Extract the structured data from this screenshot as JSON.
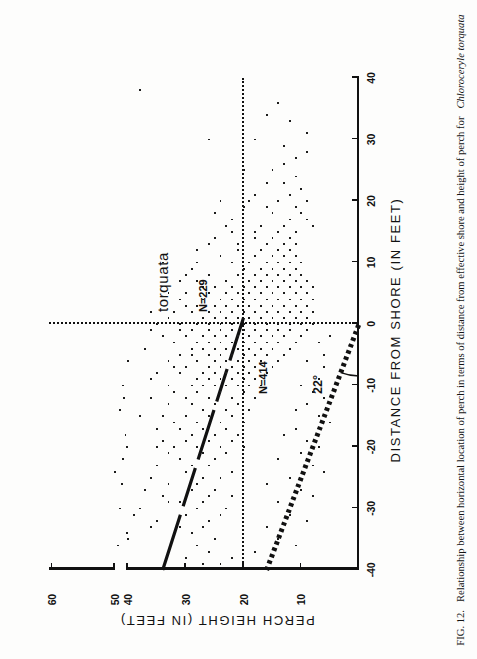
{
  "figure": {
    "caption_prefix": "FIG. 12.",
    "caption_body": "Relationship between horizontal location of perch in terms of distance from effective shore and height of perch for",
    "caption_species": "Chloroceryle torquata"
  },
  "annotations": {
    "species_label": "torquata",
    "n_upper": "N=229",
    "n_lower": "N=414",
    "angle_label": "22°"
  },
  "chart_data": {
    "type": "scatter",
    "title": "",
    "xlabel": "DISTANCE  FROM  SHORE   (IN  FEET)",
    "ylabel": "PERCH    HEIGHT    (IN FEET)",
    "xlim": [
      -40,
      40
    ],
    "ylim": [
      0,
      60
    ],
    "xticks": [
      -40,
      -30,
      -20,
      -10,
      0,
      10,
      20,
      30,
      40
    ],
    "xticklabels": [
      "-40",
      "-30",
      "-20",
      "-10",
      "0",
      "10",
      "20",
      "30",
      "40"
    ],
    "yticks": [
      10,
      20,
      30,
      40,
      50,
      60
    ],
    "yticklabels": [
      "10",
      "20",
      "30",
      "40",
      "50",
      "60"
    ],
    "y_axis_break_between": [
      40,
      50
    ],
    "grid": false,
    "legend": null,
    "reference_lines": [
      {
        "name": "shore-line",
        "orientation": "vertical",
        "x": 0,
        "style": "dotted"
      },
      {
        "name": "height-line",
        "orientation": "horizontal",
        "y": 20,
        "style": "dotted"
      }
    ],
    "fit_lines": [
      {
        "name": "regression-line",
        "style": "solid-dashed",
        "x1": -40,
        "y1": 34,
        "x2": 1,
        "y2": 20
      },
      {
        "name": "angle-ray",
        "style": "thick-dotted",
        "x1": -40,
        "y1": 16,
        "x2": 0,
        "y2": 0,
        "angle_deg": 22
      }
    ],
    "counts": {
      "above_shore": 229,
      "below_shore": 414
    },
    "points": [
      [
        -39,
        27
      ],
      [
        -38,
        30
      ],
      [
        -37,
        26
      ],
      [
        -36,
        28
      ],
      [
        -35,
        25
      ],
      [
        -34,
        29
      ],
      [
        -33,
        27
      ],
      [
        -33,
        31
      ],
      [
        -32,
        26
      ],
      [
        -31,
        30
      ],
      [
        -31,
        24
      ],
      [
        -30,
        28
      ],
      [
        -30,
        23
      ],
      [
        -29,
        27
      ],
      [
        -29,
        31
      ],
      [
        -28,
        26
      ],
      [
        -28,
        22
      ],
      [
        -27,
        29
      ],
      [
        -27,
        25
      ],
      [
        -26,
        28
      ],
      [
        -26,
        33
      ],
      [
        -25,
        24
      ],
      [
        -25,
        27
      ],
      [
        -24,
        30
      ],
      [
        -24,
        22
      ],
      [
        -23,
        26
      ],
      [
        -23,
        29
      ],
      [
        -22,
        25
      ],
      [
        -22,
        31
      ],
      [
        -21,
        23
      ],
      [
        -21,
        27
      ],
      [
        -20,
        20
      ],
      [
        -20,
        24
      ],
      [
        -20,
        28
      ],
      [
        -20,
        32
      ],
      [
        -20,
        35
      ],
      [
        -19,
        22
      ],
      [
        -19,
        26
      ],
      [
        -19,
        30
      ],
      [
        -18,
        21
      ],
      [
        -18,
        25
      ],
      [
        -18,
        29
      ],
      [
        -17,
        23
      ],
      [
        -17,
        27
      ],
      [
        -17,
        31
      ],
      [
        -16,
        20
      ],
      [
        -16,
        24
      ],
      [
        -16,
        28
      ],
      [
        -15,
        22
      ],
      [
        -15,
        26
      ],
      [
        -15,
        30
      ],
      [
        -15,
        34
      ],
      [
        -14,
        19
      ],
      [
        -14,
        23
      ],
      [
        -14,
        27
      ],
      [
        -13,
        21
      ],
      [
        -13,
        25
      ],
      [
        -13,
        29
      ],
      [
        -12,
        18
      ],
      [
        -12,
        22
      ],
      [
        -12,
        26
      ],
      [
        -12,
        30
      ],
      [
        -11,
        20
      ],
      [
        -11,
        24
      ],
      [
        -11,
        28
      ],
      [
        -10,
        17
      ],
      [
        -10,
        19
      ],
      [
        -10,
        21
      ],
      [
        -10,
        23
      ],
      [
        -10,
        25
      ],
      [
        -10,
        27
      ],
      [
        -10,
        29
      ],
      [
        -10,
        33
      ],
      [
        -9,
        18
      ],
      [
        -9,
        20
      ],
      [
        -9,
        22
      ],
      [
        -9,
        24
      ],
      [
        -9,
        26
      ],
      [
        -9,
        28
      ],
      [
        -8,
        16
      ],
      [
        -8,
        19
      ],
      [
        -8,
        21
      ],
      [
        -8,
        23
      ],
      [
        -8,
        25
      ],
      [
        -8,
        27
      ],
      [
        -7,
        15
      ],
      [
        -7,
        18
      ],
      [
        -7,
        20
      ],
      [
        -7,
        22
      ],
      [
        -7,
        24
      ],
      [
        -7,
        26
      ],
      [
        -7,
        30
      ],
      [
        -6,
        14
      ],
      [
        -6,
        17
      ],
      [
        -6,
        19
      ],
      [
        -6,
        21
      ],
      [
        -6,
        23
      ],
      [
        -6,
        25
      ],
      [
        -6,
        28
      ],
      [
        -5,
        13
      ],
      [
        -5,
        16
      ],
      [
        -5,
        18
      ],
      [
        -5,
        20
      ],
      [
        -5,
        22
      ],
      [
        -5,
        24
      ],
      [
        -5,
        26
      ],
      [
        -5,
        29
      ],
      [
        -4,
        12
      ],
      [
        -4,
        15
      ],
      [
        -4,
        17
      ],
      [
        -4,
        19
      ],
      [
        -4,
        21
      ],
      [
        -4,
        23
      ],
      [
        -4,
        25
      ],
      [
        -4,
        27
      ],
      [
        -3,
        11
      ],
      [
        -3,
        14
      ],
      [
        -3,
        16
      ],
      [
        -3,
        18
      ],
      [
        -3,
        20
      ],
      [
        -3,
        22
      ],
      [
        -3,
        24
      ],
      [
        -3,
        26
      ],
      [
        -3,
        28
      ],
      [
        -2,
        10
      ],
      [
        -2,
        13
      ],
      [
        -2,
        15
      ],
      [
        -2,
        17
      ],
      [
        -2,
        19
      ],
      [
        -2,
        21
      ],
      [
        -2,
        23
      ],
      [
        -2,
        25
      ],
      [
        -2,
        27
      ],
      [
        -1,
        9
      ],
      [
        -1,
        12
      ],
      [
        -1,
        14
      ],
      [
        -1,
        16
      ],
      [
        -1,
        18
      ],
      [
        -1,
        20
      ],
      [
        -1,
        22
      ],
      [
        -1,
        24
      ],
      [
        -1,
        26
      ],
      [
        -1,
        29
      ],
      [
        0,
        8
      ],
      [
        0,
        10
      ],
      [
        0,
        12
      ],
      [
        0,
        14
      ],
      [
        0,
        16
      ],
      [
        0,
        18
      ],
      [
        0,
        20
      ],
      [
        0,
        22
      ],
      [
        0,
        24
      ],
      [
        0,
        26
      ],
      [
        0,
        28
      ],
      [
        0,
        31
      ],
      [
        1,
        9
      ],
      [
        1,
        11
      ],
      [
        1,
        13
      ],
      [
        1,
        15
      ],
      [
        1,
        17
      ],
      [
        1,
        19
      ],
      [
        1,
        21
      ],
      [
        1,
        23
      ],
      [
        1,
        25
      ],
      [
        1,
        27
      ],
      [
        2,
        8
      ],
      [
        2,
        10
      ],
      [
        2,
        12
      ],
      [
        2,
        14
      ],
      [
        2,
        16
      ],
      [
        2,
        18
      ],
      [
        2,
        20
      ],
      [
        2,
        22
      ],
      [
        2,
        24
      ],
      [
        2,
        26
      ],
      [
        2,
        29
      ],
      [
        3,
        9
      ],
      [
        3,
        11
      ],
      [
        3,
        13
      ],
      [
        3,
        15
      ],
      [
        3,
        17
      ],
      [
        3,
        19
      ],
      [
        3,
        21
      ],
      [
        3,
        23
      ],
      [
        3,
        25
      ],
      [
        3,
        28
      ],
      [
        4,
        8
      ],
      [
        4,
        10
      ],
      [
        4,
        12
      ],
      [
        4,
        14
      ],
      [
        4,
        16
      ],
      [
        4,
        18
      ],
      [
        4,
        20
      ],
      [
        4,
        22
      ],
      [
        4,
        24
      ],
      [
        4,
        27
      ],
      [
        5,
        9
      ],
      [
        5,
        11
      ],
      [
        5,
        13
      ],
      [
        5,
        15
      ],
      [
        5,
        17
      ],
      [
        5,
        19
      ],
      [
        5,
        21
      ],
      [
        5,
        23
      ],
      [
        5,
        26
      ],
      [
        5,
        30
      ],
      [
        6,
        8
      ],
      [
        6,
        10
      ],
      [
        6,
        12
      ],
      [
        6,
        14
      ],
      [
        6,
        16
      ],
      [
        6,
        18
      ],
      [
        6,
        20
      ],
      [
        6,
        22
      ],
      [
        6,
        25
      ],
      [
        7,
        9
      ],
      [
        7,
        11
      ],
      [
        7,
        13
      ],
      [
        7,
        15
      ],
      [
        7,
        17
      ],
      [
        7,
        19
      ],
      [
        7,
        23
      ],
      [
        8,
        10
      ],
      [
        8,
        12
      ],
      [
        8,
        14
      ],
      [
        8,
        16
      ],
      [
        8,
        18
      ],
      [
        8,
        21
      ],
      [
        8,
        26
      ],
      [
        9,
        11
      ],
      [
        9,
        13
      ],
      [
        9,
        15
      ],
      [
        9,
        17
      ],
      [
        9,
        20
      ],
      [
        10,
        10
      ],
      [
        10,
        12
      ],
      [
        10,
        14
      ],
      [
        10,
        16
      ],
      [
        10,
        19
      ],
      [
        10,
        22
      ],
      [
        10,
        34
      ],
      [
        11,
        11
      ],
      [
        11,
        13
      ],
      [
        11,
        15
      ],
      [
        11,
        18
      ],
      [
        12,
        12
      ],
      [
        12,
        14
      ],
      [
        12,
        17
      ],
      [
        12,
        21
      ],
      [
        13,
        11
      ],
      [
        13,
        13
      ],
      [
        13,
        16
      ],
      [
        13,
        26
      ],
      [
        14,
        12
      ],
      [
        14,
        15
      ],
      [
        14,
        18
      ],
      [
        15,
        11
      ],
      [
        15,
        14
      ],
      [
        15,
        22
      ],
      [
        16,
        8
      ],
      [
        16,
        13
      ],
      [
        16,
        17
      ],
      [
        17,
        9
      ],
      [
        17,
        12
      ],
      [
        18,
        10
      ],
      [
        18,
        15
      ],
      [
        19,
        11
      ],
      [
        19,
        20
      ],
      [
        20,
        9
      ],
      [
        20,
        14
      ],
      [
        20,
        19
      ],
      [
        20,
        24
      ],
      [
        21,
        12
      ],
      [
        22,
        10
      ],
      [
        23,
        16
      ],
      [
        24,
        11
      ],
      [
        25,
        20
      ],
      [
        26,
        13
      ],
      [
        28,
        9
      ],
      [
        30,
        18
      ],
      [
        30,
        26
      ],
      [
        33,
        12
      ],
      [
        36,
        14
      ],
      [
        38,
        38
      ],
      [
        -25,
        36
      ],
      [
        -30,
        38
      ],
      [
        -35,
        40
      ],
      [
        -12,
        36
      ],
      [
        -8,
        35
      ],
      [
        -15,
        38
      ],
      [
        -20,
        41
      ],
      [
        -28,
        34
      ],
      [
        -33,
        36
      ],
      [
        -18,
        42
      ],
      [
        -6,
        33
      ],
      [
        -2,
        34
      ],
      [
        -22,
        44
      ],
      [
        -26,
        45
      ],
      [
        -30,
        46
      ],
      [
        -36,
        48
      ],
      [
        -24,
        50
      ],
      [
        -14,
        46
      ],
      [
        -4,
        37
      ],
      [
        -10,
        44
      ],
      [
        -17,
        35
      ],
      [
        -21,
        33
      ],
      [
        -11,
        32
      ],
      [
        -7,
        32
      ],
      [
        -13,
        33
      ],
      [
        -19,
        34
      ],
      [
        -23,
        35
      ],
      [
        -27,
        37
      ],
      [
        -31,
        39
      ],
      [
        -34,
        41
      ],
      [
        -9,
        36
      ],
      [
        -5,
        31
      ],
      [
        -16,
        32
      ],
      [
        -29,
        33
      ],
      [
        -32,
        35
      ],
      [
        -6,
        40
      ],
      [
        -12,
        43
      ],
      [
        -2,
        30
      ],
      [
        -3,
        32
      ],
      [
        -8,
        31
      ],
      [
        -4,
        29
      ],
      [
        -1,
        31
      ],
      [
        2,
        32
      ],
      [
        5,
        33
      ],
      [
        8,
        30
      ],
      [
        1,
        33
      ],
      [
        4,
        31
      ],
      [
        7,
        28
      ],
      [
        3,
        30
      ],
      [
        6,
        27
      ],
      [
        9,
        29
      ],
      [
        0,
        35
      ],
      [
        -1,
        36
      ],
      [
        2,
        36
      ],
      [
        -21,
        10
      ],
      [
        -25,
        12
      ],
      [
        -29,
        14
      ],
      [
        -33,
        16
      ],
      [
        -37,
        18
      ],
      [
        -23,
        8
      ],
      [
        -27,
        10
      ],
      [
        -31,
        12
      ],
      [
        -19,
        9
      ],
      [
        -15,
        7
      ],
      [
        -11,
        8
      ],
      [
        -35,
        14
      ],
      [
        -17,
        11
      ],
      [
        -13,
        9
      ],
      [
        -9,
        7
      ],
      [
        -5,
        6
      ],
      [
        -2,
        5
      ],
      [
        -7,
        6
      ],
      [
        -3,
        7
      ],
      [
        -24,
        6
      ],
      [
        -20,
        7
      ],
      [
        -16,
        5
      ],
      [
        -12,
        6
      ],
      [
        -28,
        8
      ],
      [
        -32,
        9
      ],
      [
        -36,
        11
      ],
      [
        -26,
        16
      ],
      [
        -22,
        14
      ],
      [
        -18,
        13
      ],
      [
        -14,
        11
      ],
      [
        -10,
        10
      ],
      [
        -6,
        9
      ],
      [
        -38,
        22
      ],
      [
        -39,
        24
      ],
      [
        11,
        24
      ],
      [
        13,
        21
      ],
      [
        15,
        18
      ],
      [
        17,
        22
      ],
      [
        19,
        16
      ],
      [
        21,
        18
      ],
      [
        23,
        13
      ],
      [
        25,
        15
      ],
      [
        27,
        11
      ],
      [
        29,
        13
      ],
      [
        31,
        9
      ],
      [
        34,
        16
      ],
      [
        12,
        28
      ],
      [
        14,
        25
      ],
      [
        16,
        23
      ],
      [
        18,
        25
      ],
      [
        7,
        31
      ],
      [
        10,
        28
      ]
    ]
  }
}
